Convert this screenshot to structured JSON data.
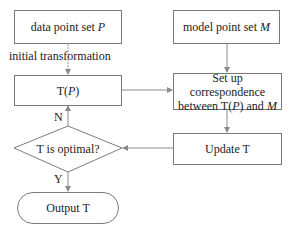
{
  "diagram": {
    "type": "flowchart",
    "nodes": {
      "data_set": {
        "text": "data point set ",
        "var": "P"
      },
      "model_set": {
        "text": "model point set ",
        "var": "M"
      },
      "transformed": {
        "prefix": "T(",
        "var": "P",
        "suffix": ")"
      },
      "correspondence": {
        "line1": "Set up correspondence",
        "line2_prefix": "between T(",
        "line2_var": "P",
        "line2_mid": ") and ",
        "line2_var2": "M"
      },
      "update": {
        "text": "Update T"
      },
      "decision": {
        "text": "T is optimal?"
      },
      "output": {
        "text": "Output T"
      }
    },
    "edge_labels": {
      "initial": "initial transformation",
      "no": "N",
      "yes": "Y"
    },
    "edges": [
      {
        "from": "data_set",
        "to": "transformed",
        "label": "initial transformation"
      },
      {
        "from": "model_set",
        "to": "correspondence"
      },
      {
        "from": "transformed",
        "to": "correspondence"
      },
      {
        "from": "correspondence",
        "to": "update"
      },
      {
        "from": "update",
        "to": "decision"
      },
      {
        "from": "decision",
        "to": "transformed",
        "label": "N"
      },
      {
        "from": "decision",
        "to": "output",
        "label": "Y"
      }
    ],
    "colors": {
      "line": "#8a8a8a",
      "border": "#7a7a7a",
      "text": "#222222"
    }
  }
}
